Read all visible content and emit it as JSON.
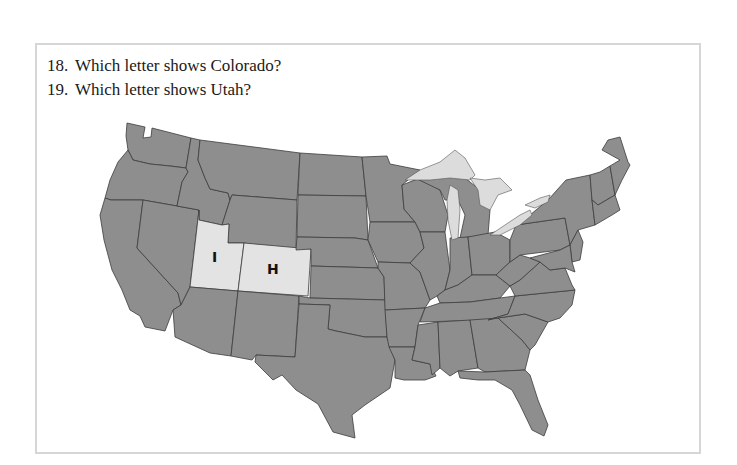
{
  "questions": [
    {
      "number": "18.",
      "text": "Which letter shows Colorado?"
    },
    {
      "number": "19.",
      "text": "Which letter shows Utah?"
    }
  ],
  "map": {
    "title": "United States map",
    "labels": [
      {
        "letter": "I",
        "state": "Utah"
      },
      {
        "letter": "H",
        "state": "Colorado"
      }
    ],
    "colors": {
      "state_fill": "#8e8e8e",
      "highlight_fill": "#e3e3e3",
      "border": "#3c3c3c",
      "lake_fill": "#dcdcdc"
    }
  }
}
